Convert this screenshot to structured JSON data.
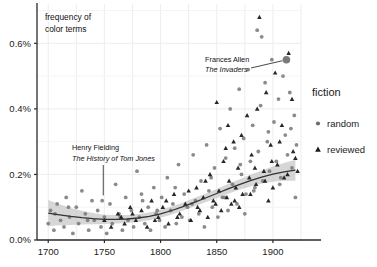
{
  "chart_data": {
    "type": "scatter",
    "title": "",
    "inplot_label": [
      "frequency of",
      "color terms"
    ],
    "xlabel": "",
    "ylabel": "frequency of color terms",
    "xlim": [
      1690,
      1925
    ],
    "ylim": [
      0.0,
      0.0072
    ],
    "x_ticks": [
      1700,
      1750,
      1800,
      1850,
      1900
    ],
    "x_tick_labels": [
      "1700",
      "1750",
      "1800",
      "1850",
      "1900"
    ],
    "y_ticks": [
      0.0,
      0.002,
      0.004,
      0.006
    ],
    "y_tick_labels": [
      "0.0%",
      "0.2%",
      "0.4%",
      "0.6%"
    ],
    "grid": true,
    "grid_minor_x_step": 25,
    "grid_color": "#ededed",
    "legend": {
      "title": "fiction",
      "position": "right",
      "entries": [
        {
          "label": "random",
          "marker": "circle",
          "color": "#6e6e6e"
        },
        {
          "label": "reviewed",
          "marker": "triangle",
          "color": "#1a1a1a"
        }
      ]
    },
    "annotations": [
      {
        "name": "frances-allen",
        "line1": "Frances Allen",
        "line2": "The Invaders",
        "x": 1912,
        "y": 0.0055,
        "leader": true
      },
      {
        "name": "henry-fielding",
        "line1": "Henry Fielding",
        "line2": "The History of Tom Jones",
        "x": 1749,
        "y": 0.0013,
        "leader": true
      }
    ],
    "trend": {
      "name": "loess",
      "color": "#333333",
      "band_color": "#c8c8c8",
      "points": [
        [
          1700,
          0.00082
        ],
        [
          1710,
          0.00077
        ],
        [
          1720,
          0.00072
        ],
        [
          1730,
          0.00068
        ],
        [
          1740,
          0.00065
        ],
        [
          1750,
          0.00063
        ],
        [
          1760,
          0.00063
        ],
        [
          1770,
          0.00064
        ],
        [
          1780,
          0.00067
        ],
        [
          1790,
          0.00072
        ],
        [
          1800,
          0.0008
        ],
        [
          1810,
          0.0009
        ],
        [
          1820,
          0.00102
        ],
        [
          1830,
          0.00115
        ],
        [
          1840,
          0.00128
        ],
        [
          1850,
          0.00142
        ],
        [
          1860,
          0.00156
        ],
        [
          1870,
          0.00169
        ],
        [
          1880,
          0.00181
        ],
        [
          1890,
          0.00192
        ],
        [
          1900,
          0.00201
        ],
        [
          1910,
          0.00208
        ],
        [
          1920,
          0.00213
        ]
      ],
      "band_half_width": [
        0.0004,
        0.00032,
        0.00026,
        0.00021,
        0.00017,
        0.00014,
        0.00013,
        0.00012,
        0.00012,
        0.00012,
        0.00012,
        0.00012,
        0.00012,
        0.00013,
        0.00013,
        0.00014,
        0.00015,
        0.00016,
        0.00018,
        0.0002,
        0.00023,
        0.00027,
        0.00032
      ]
    },
    "series": [
      {
        "name": "random",
        "marker": "circle",
        "color": "#767676",
        "points": [
          [
            1700,
            0.0005
          ],
          [
            1702,
            0.0009
          ],
          [
            1705,
            0.0003
          ],
          [
            1708,
            0.0011
          ],
          [
            1711,
            0.0006
          ],
          [
            1714,
            0.0004
          ],
          [
            1716,
            0.0013
          ],
          [
            1719,
            0.0007
          ],
          [
            1722,
            0.0002
          ],
          [
            1725,
            0.001
          ],
          [
            1727,
            0.0005
          ],
          [
            1730,
            0.0015
          ],
          [
            1733,
            0.0008
          ],
          [
            1736,
            0.0003
          ],
          [
            1739,
            0.0012
          ],
          [
            1741,
            0.0006
          ],
          [
            1744,
            0.0009
          ],
          [
            1747,
            0.0004
          ],
          [
            1750,
            0.0007
          ],
          [
            1752,
            0.0002
          ],
          [
            1755,
            0.0011
          ],
          [
            1757,
            0.0005
          ],
          [
            1760,
            0.0017
          ],
          [
            1763,
            0.0008
          ],
          [
            1766,
            0.0003
          ],
          [
            1769,
            0.0013
          ],
          [
            1771,
            0.0006
          ],
          [
            1774,
            0.0009
          ],
          [
            1776,
            0.0004
          ],
          [
            1779,
            0.0021
          ],
          [
            1781,
            0.0007
          ],
          [
            1784,
            0.0012
          ],
          [
            1786,
            0.0005
          ],
          [
            1789,
            0.001
          ],
          [
            1791,
            0.0003
          ],
          [
            1794,
            0.0016
          ],
          [
            1796,
            0.0008
          ],
          [
            1799,
            0.0006
          ],
          [
            1801,
            0.0013
          ],
          [
            1804,
            0.0004
          ],
          [
            1806,
            0.0019
          ],
          [
            1809,
            0.0009
          ],
          [
            1811,
            0.0011
          ],
          [
            1814,
            0.0005
          ],
          [
            1816,
            0.0023
          ],
          [
            1819,
            0.0007
          ],
          [
            1821,
            0.0014
          ],
          [
            1824,
            0.001
          ],
          [
            1826,
            0.0006
          ],
          [
            1829,
            0.0026
          ],
          [
            1831,
            0.0012
          ],
          [
            1834,
            0.0008
          ],
          [
            1836,
            0.0018
          ],
          [
            1839,
            0.0004
          ],
          [
            1841,
            0.0029
          ],
          [
            1843,
            0.0015
          ],
          [
            1846,
            0.001
          ],
          [
            1848,
            0.0022
          ],
          [
            1851,
            0.0007
          ],
          [
            1853,
            0.0034
          ],
          [
            1855,
            0.0013
          ],
          [
            1858,
            0.0025
          ],
          [
            1860,
            0.0009
          ],
          [
            1862,
            0.004
          ],
          [
            1864,
            0.0017
          ],
          [
            1866,
            0.0028
          ],
          [
            1868,
            0.0011
          ],
          [
            1870,
            0.0046
          ],
          [
            1872,
            0.002
          ],
          [
            1874,
            0.0031
          ],
          [
            1876,
            0.0014
          ],
          [
            1878,
            0.0052
          ],
          [
            1880,
            0.0024
          ],
          [
            1882,
            0.0035
          ],
          [
            1884,
            0.0016
          ],
          [
            1886,
            0.0064
          ],
          [
            1887,
            0.0027
          ],
          [
            1889,
            0.0041
          ],
          [
            1891,
            0.0018
          ],
          [
            1893,
            0.0048
          ],
          [
            1895,
            0.003
          ],
          [
            1897,
            0.0021
          ],
          [
            1899,
            0.0055
          ],
          [
            1901,
            0.0036
          ],
          [
            1903,
            0.0024
          ],
          [
            1905,
            0.0043
          ],
          [
            1907,
            0.0019
          ],
          [
            1909,
            0.005
          ],
          [
            1911,
            0.0032
          ],
          [
            1913,
            0.0026
          ],
          [
            1915,
            0.0045
          ],
          [
            1917,
            0.0022
          ],
          [
            1919,
            0.0038
          ],
          [
            1921,
            0.0029
          ],
          [
            1706,
            0.0008
          ],
          [
            1718,
            0.001
          ],
          [
            1735,
            0.0006
          ],
          [
            1748,
            0.0012
          ],
          [
            1764,
            0.0007
          ],
          [
            1783,
            0.0014
          ],
          [
            1797,
            0.0009
          ],
          [
            1813,
            0.0016
          ],
          [
            1828,
            0.0011
          ],
          [
            1845,
            0.0019
          ],
          [
            1857,
            0.0013
          ],
          [
            1871,
            0.0023
          ],
          [
            1883,
            0.0015
          ],
          [
            1896,
            0.0033
          ],
          [
            1906,
            0.0017
          ],
          [
            1916,
            0.0034
          ],
          [
            1920,
            0.0013
          ],
          [
            1912,
            0.0055
          ],
          [
            1890,
            0.0062
          ],
          [
            1875,
            0.0008
          ]
        ]
      },
      {
        "name": "reviewed",
        "marker": "triangle",
        "color": "#151515",
        "points": [
          [
            1750,
            0.0006
          ],
          [
            1756,
            0.0004
          ],
          [
            1762,
            0.0008
          ],
          [
            1768,
            0.0005
          ],
          [
            1773,
            0.001
          ],
          [
            1778,
            0.0006
          ],
          [
            1783,
            0.0009
          ],
          [
            1788,
            0.0004
          ],
          [
            1792,
            0.0012
          ],
          [
            1798,
            0.0007
          ],
          [
            1802,
            0.001
          ],
          [
            1807,
            0.0005
          ],
          [
            1812,
            0.0014
          ],
          [
            1817,
            0.0008
          ],
          [
            1822,
            0.0011
          ],
          [
            1827,
            0.0006
          ],
          [
            1832,
            0.0016
          ],
          [
            1835,
            0.0009
          ],
          [
            1838,
            0.0013
          ],
          [
            1842,
            0.0007
          ],
          [
            1844,
            0.002
          ],
          [
            1847,
            0.0012
          ],
          [
            1850,
            0.0042
          ],
          [
            1852,
            0.0015
          ],
          [
            1854,
            0.0009
          ],
          [
            1856,
            0.0024
          ],
          [
            1859,
            0.0013
          ],
          [
            1861,
            0.0018
          ],
          [
            1863,
            0.0011
          ],
          [
            1865,
            0.003
          ],
          [
            1867,
            0.0016
          ],
          [
            1869,
            0.0022
          ],
          [
            1873,
            0.0014
          ],
          [
            1877,
            0.0038
          ],
          [
            1879,
            0.0019
          ],
          [
            1881,
            0.0026
          ],
          [
            1885,
            0.0017
          ],
          [
            1888,
            0.0068
          ],
          [
            1892,
            0.0021
          ],
          [
            1894,
            0.0045
          ],
          [
            1898,
            0.0029
          ],
          [
            1900,
            0.0016
          ],
          [
            1902,
            0.0051
          ],
          [
            1904,
            0.0023
          ],
          [
            1908,
            0.0035
          ],
          [
            1910,
            0.0019
          ],
          [
            1914,
            0.0057
          ],
          [
            1918,
            0.0027
          ],
          [
            1922,
            0.0021
          ],
          [
            1765,
            0.0007
          ],
          [
            1775,
            0.0008
          ],
          [
            1795,
            0.0006
          ],
          [
            1805,
            0.0012
          ],
          [
            1815,
            0.0007
          ],
          [
            1825,
            0.0015
          ],
          [
            1833,
            0.001
          ],
          [
            1840,
            0.0018
          ],
          [
            1849,
            0.0011
          ],
          [
            1858,
            0.0028
          ],
          [
            1866,
            0.0012
          ],
          [
            1872,
            0.0032
          ],
          [
            1880,
            0.0014
          ],
          [
            1886,
            0.004
          ],
          [
            1893,
            0.0018
          ],
          [
            1899,
            0.0024
          ],
          [
            1906,
            0.003
          ],
          [
            1913,
            0.002
          ],
          [
            1917,
            0.0043
          ],
          [
            1920,
            0.0025
          ],
          [
            1896,
            0.0012
          ],
          [
            1884,
            0.0022
          ],
          [
            1870,
            0.001
          ],
          [
            1860,
            0.0035
          ]
        ]
      }
    ]
  }
}
